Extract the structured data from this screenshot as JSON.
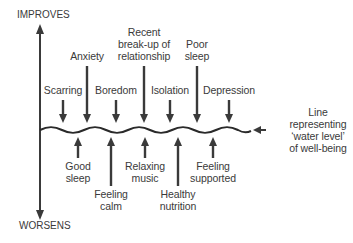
{
  "axis": {
    "top_label": "IMPROVES",
    "bottom_label": "WORSENS"
  },
  "water_line_label": [
    "Line",
    "representing",
    "‘water level’",
    "of well-being"
  ],
  "negative_factors": [
    {
      "lines": [
        "Scarring"
      ],
      "x": 63
    },
    {
      "lines": [
        "Anxiety"
      ],
      "x": 87
    },
    {
      "lines": [
        "Boredom"
      ],
      "x": 116
    },
    {
      "lines": [
        "Recent",
        "break-up of",
        "relationship"
      ],
      "x": 144
    },
    {
      "lines": [
        "Isolation"
      ],
      "x": 170
    },
    {
      "lines": [
        "Poor",
        "sleep"
      ],
      "x": 197
    },
    {
      "lines": [
        "Depression"
      ],
      "x": 229
    }
  ],
  "positive_factors": [
    {
      "lines": [
        "Good",
        "sleep"
      ],
      "x": 78
    },
    {
      "lines": [
        "Feeling",
        "calm"
      ],
      "x": 111
    },
    {
      "lines": [
        "Relaxing",
        "music"
      ],
      "x": 145
    },
    {
      "lines": [
        "Healthy",
        "nutrition"
      ],
      "x": 178
    },
    {
      "lines": [
        "Feeling",
        "supported"
      ],
      "x": 213
    }
  ],
  "colors": {
    "ink": "#3a3a3a",
    "background": "#ffffff"
  }
}
